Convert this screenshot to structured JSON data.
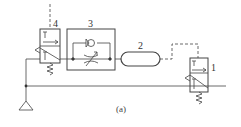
{
  "diagram": {
    "caption": "(a)",
    "colors": {
      "line": "#555555",
      "stroke": "#333333",
      "background": "#ffffff"
    },
    "components": [
      {
        "id": "valve-4",
        "label": "4",
        "type": "2/2 directional valve, pilot operated, spring return"
      },
      {
        "id": "flow-control-3",
        "label": "3",
        "type": "one-way flow control valve (check valve + variable throttle)"
      },
      {
        "id": "tank-2",
        "label": "2",
        "type": "air reservoir"
      },
      {
        "id": "valve-1",
        "label": "1",
        "type": "2/2 directional valve, pilot operated, spring return"
      }
    ],
    "symbols": [
      "exhaust-triangle",
      "junction-dot",
      "pilot-line-dashed"
    ]
  }
}
